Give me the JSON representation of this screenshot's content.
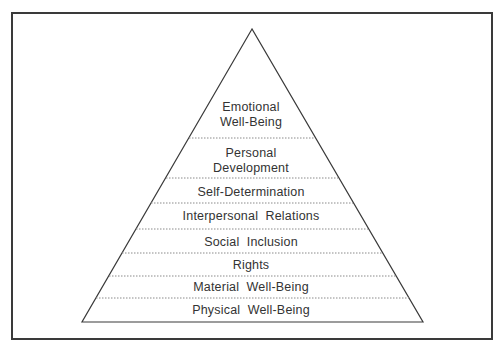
{
  "diagram": {
    "type": "pyramid",
    "levels_top_to_bottom": [
      {
        "label_lines": [
          "Emotional",
          "Well-Being"
        ]
      },
      {
        "label_lines": [
          "Personal",
          "Development"
        ]
      },
      {
        "label_lines": [
          "Self-Determination"
        ]
      },
      {
        "label_lines": [
          "Interpersonal  Relations"
        ]
      },
      {
        "label_lines": [
          "Social  Inclusion"
        ]
      },
      {
        "label_lines": [
          "Rights"
        ]
      },
      {
        "label_lines": [
          "Material  Well-Being"
        ]
      },
      {
        "label_lines": [
          "Physical  Well-Being"
        ]
      }
    ],
    "colors": {
      "outline": "#3a3a3a",
      "divider": "#8a8a8a",
      "text": "#333333",
      "background": "#ffffff"
    }
  }
}
